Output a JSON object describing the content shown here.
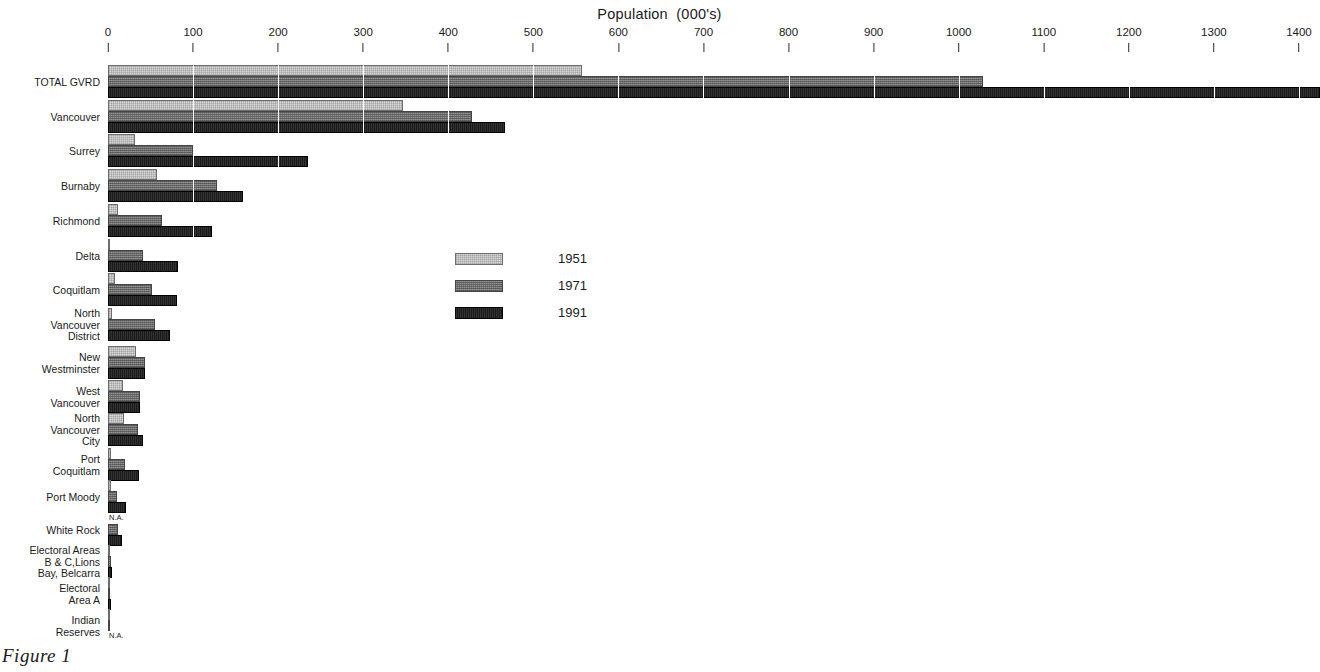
{
  "caption": "Figure 1",
  "axis": {
    "title": "Population  (000's)",
    "ticks": [
      "0",
      "100",
      "200",
      "300",
      "400",
      "500",
      "600",
      "700",
      "800",
      "900",
      "1000",
      "1100",
      "1200",
      "1300",
      "1400"
    ]
  },
  "legend": {
    "position": "center-left-inset",
    "items": [
      {
        "label": "1951",
        "color": "#d8d8d8"
      },
      {
        "label": "1971",
        "color": "#7d7d7d"
      },
      {
        "label": "1991",
        "color": "#1b1b1b"
      }
    ]
  },
  "chart_data": {
    "type": "bar",
    "orientation": "horizontal",
    "title": "Population  (000's)",
    "xlabel": "Population  (000's)",
    "ylabel": "",
    "xlim": [
      0,
      1425
    ],
    "grid": true,
    "legend_entries": [
      "1951",
      "1971",
      "1991"
    ],
    "xticks": [
      0,
      100,
      200,
      300,
      400,
      500,
      600,
      700,
      800,
      900,
      1000,
      1100,
      1200,
      1300,
      1400
    ],
    "categories": [
      "TOTAL GVRD",
      "Vancouver",
      "Surrey",
      "Burnaby",
      "Richmond",
      "Delta",
      "Coquitlam",
      "North\nVancouver\nDistrict",
      "New\nWestminster",
      "West\nVancouver",
      "North\nVancouver\nCity",
      "Port\nCoquitlam",
      "Port Moody",
      "White Rock",
      "Electoral Areas\nB & C,Lions\nBay, Belcarra",
      "Electoral\nArea A",
      "Indian\nReserves"
    ],
    "series": [
      {
        "name": "1951",
        "values": [
          557,
          347,
          32,
          58,
          12,
          2,
          8,
          5,
          33,
          18,
          19,
          4,
          4,
          null,
          2,
          1,
          1
        ],
        "na_indices": [
          13
        ]
      },
      {
        "name": "1971",
        "values": [
          1028,
          428,
          100,
          128,
          63,
          41,
          52,
          55,
          43,
          38,
          35,
          20,
          11,
          12,
          3,
          2,
          1
        ],
        "na_indices": []
      },
      {
        "name": "1991",
        "values": [
          1425,
          467,
          235,
          159,
          122,
          82,
          81,
          73,
          43,
          38,
          41,
          36,
          21,
          16,
          5,
          3,
          null
        ],
        "na_indices": [
          16
        ]
      }
    ],
    "annotations": [
      {
        "text": "N.A.",
        "category": "White Rock",
        "series": "1951"
      },
      {
        "text": "N.A.",
        "category": "Indian Reserves",
        "series": "1991"
      }
    ]
  }
}
